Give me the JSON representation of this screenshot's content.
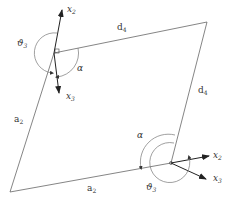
{
  "diagram": {
    "type": "four-bar-linkage",
    "colors": {
      "line": "#555555",
      "arrow": "#222222",
      "text": "#333333",
      "background": "#ffffff"
    },
    "vertices": {
      "upper_left_joint": [
        54,
        53
      ],
      "upper_right": [
        207,
        22
      ],
      "lower_right_joint": [
        171,
        163
      ],
      "lower_left": [
        10,
        192
      ]
    },
    "labels": {
      "upper_x2": "x",
      "upper_x2_sub": "2",
      "upper_x3": "x",
      "upper_x3_sub": "3",
      "upper_theta": "ϑ",
      "upper_theta_sub": "3",
      "upper_alpha": "α",
      "top_link": "d",
      "top_link_sub": "4",
      "right_link": "d",
      "right_link_sub": "4",
      "left_link": "a",
      "left_link_sub": "2",
      "bottom_link": "a",
      "bottom_link_sub": "2",
      "lower_alpha": "α",
      "lower_x2": "x",
      "lower_x2_sub": "2",
      "lower_x3": "x",
      "lower_x3_sub": "3",
      "lower_theta": "ϑ",
      "lower_theta_sub": "3"
    }
  }
}
